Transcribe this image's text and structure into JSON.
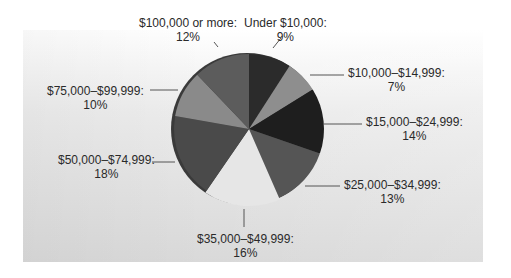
{
  "chart_data": {
    "type": "pie",
    "title": "",
    "categories": [
      "Under $10,000",
      "$10,000–$14,999",
      "$15,000–$24,999",
      "$25,000–$34,999",
      "$35,000–$49,999",
      "$50,000–$74,999",
      "$75,000–$99,999",
      "$100,000 or more"
    ],
    "values": [
      9,
      7,
      14,
      13,
      16,
      18,
      10,
      12
    ],
    "unit": "%",
    "start_angle": "12 o'clock, clockwise",
    "legend": "none (direct labels with leader lines)",
    "colors": [
      "#2b2b2b",
      "#8e8e8e",
      "#1e1e1e",
      "#555555",
      "#e6e6e6",
      "#4a4a4a",
      "#8a8a8a",
      "#5c5c5c"
    ]
  },
  "labels": [
    {
      "name": "Under $10,000:",
      "pct": "9%",
      "left": 244,
      "top": 16
    },
    {
      "name": "$10,000–$14,999:",
      "pct": "7%",
      "left": 348,
      "top": 66
    },
    {
      "name": "$15,000–$24,999:",
      "pct": "14%",
      "left": 366,
      "top": 115
    },
    {
      "name": "$25,000–$34,999:",
      "pct": "13%",
      "left": 344,
      "top": 178
    },
    {
      "name": "$35,000–$49,999:",
      "pct": "16%",
      "left": 197,
      "top": 232
    },
    {
      "name": "$50,000–$74,999:",
      "pct": "18%",
      "left": 58,
      "top": 153
    },
    {
      "name": "$75,000–$99,999:",
      "pct": "10%",
      "left": 47,
      "top": 84
    },
    {
      "name": "$100,000 or more:",
      "pct": "12%",
      "left": 139,
      "top": 16
    }
  ],
  "leaders": [
    [
      [
        273,
        48
      ],
      [
        281,
        38
      ]
    ],
    [
      [
        310,
        75
      ],
      [
        344,
        75
      ]
    ],
    [
      [
        323,
        124
      ],
      [
        362,
        124
      ]
    ],
    [
      [
        305,
        186
      ],
      [
        340,
        186
      ]
    ],
    [
      [
        244,
        209
      ],
      [
        244,
        227
      ]
    ],
    [
      [
        152,
        162
      ],
      [
        175,
        162
      ]
    ],
    [
      [
        150,
        90
      ],
      [
        178,
        90
      ]
    ],
    [
      [
        218,
        47
      ],
      [
        214,
        42
      ]
    ]
  ],
  "geometry": {
    "cx": 249,
    "cy": 129,
    "r": 75,
    "rim": 5
  }
}
